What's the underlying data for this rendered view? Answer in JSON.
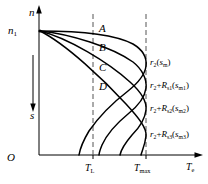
{
  "figure": {
    "type": "schematic-plot"
  },
  "axes": {
    "y_axis_label": "n",
    "y_axis_marker_label": "n",
    "y_axis_marker_sub": "1",
    "origin_label": "O",
    "slip_arrow_label": "s",
    "x_axis_label": "T",
    "x_axis_label_sub": "e"
  },
  "ticks": [
    {
      "name": "T-L",
      "label": "T",
      "sub": "L"
    },
    {
      "name": "T-max",
      "label": "T",
      "sub": "max"
    }
  ],
  "curve_points": [
    {
      "label": "A"
    },
    {
      "label": "B"
    },
    {
      "label": "C"
    },
    {
      "label": "D"
    }
  ],
  "curves": [
    {
      "name": "curve-r2",
      "text": "r₂(sₘ)",
      "base": "r",
      "base_sub": "2",
      "arg": "(s",
      "arg_sub": "m",
      "arg_close": ")"
    },
    {
      "name": "curve-r2-Rs1",
      "text": "r₂+Rₛ₁(sₘ₁)",
      "base": "r",
      "base_sub": "2",
      "arg": "(s",
      "arg_sub": "m1",
      "arg_close": ")"
    },
    {
      "name": "curve-r2-Rs2",
      "text": "r₂+Rₛ₂(sₘ₂)",
      "base": "r",
      "base_sub": "2",
      "arg": "(s",
      "arg_sub": "m2",
      "arg_close": ")"
    },
    {
      "name": "curve-r2-Rs3",
      "text": "r₂+Rₛ₃(sₘ₃)",
      "base": "r",
      "base_sub": "2",
      "arg": "(s",
      "arg_sub": "m3",
      "arg_close": ")"
    }
  ],
  "curve_labels": {
    "c0": {
      "r": "r",
      "r_sub": "2",
      "open": "(",
      "s": "s",
      "s_sub": "m",
      "close": ")"
    },
    "c1": {
      "r": "r",
      "r_sub": "2",
      "plus": "+",
      "R": "R",
      "R_sub": "s1",
      "open": "(",
      "s": "s",
      "s_sub": "m1",
      "close": ")"
    },
    "c2": {
      "r": "r",
      "r_sub": "2",
      "plus": "+",
      "R": "R",
      "R_sub": "s2",
      "open": "(",
      "s": "s",
      "s_sub": "m2",
      "close": ")"
    },
    "c3": {
      "r": "r",
      "r_sub": "2",
      "plus": "+",
      "R": "R",
      "R_sub": "s3",
      "open": "(",
      "s": "s",
      "s_sub": "m3",
      "close": ")"
    }
  },
  "colors": {
    "stroke": "#000000",
    "background": "#ffffff",
    "dashed": "#555555"
  }
}
